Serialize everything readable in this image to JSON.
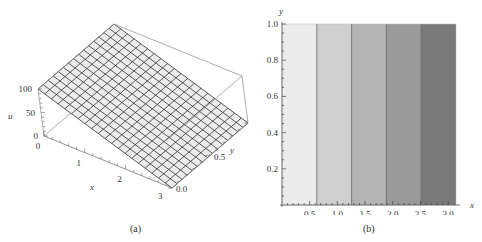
{
  "figure": {
    "panel_a_caption": "(a)",
    "panel_b_caption": "(b)"
  },
  "chart_data": [
    {
      "type": "surface3d",
      "panel": "(a)",
      "title": "",
      "xlabel": "x",
      "ylabel": "y",
      "zlabel": "u",
      "x_ticks": [
        "0",
        "1",
        "2",
        "3"
      ],
      "y_ticks": [
        "0.0",
        "0.5",
        "1.0"
      ],
      "z_ticks": [
        "0",
        "50",
        "100"
      ],
      "xlim": [
        0,
        3.14159
      ],
      "ylim": [
        0,
        1
      ],
      "zlim": [
        0,
        100
      ],
      "description": "Planar surface u decreasing linearly from 100 at x=0 to 0 at x=pi, independent of y",
      "surface": {
        "u_at_x0": 100,
        "u_at_xpi": 0
      },
      "mesh": {
        "x_lines": 20,
        "y_lines": 15
      },
      "surface_color": "#ececec",
      "mesh_color": "#333333"
    },
    {
      "type": "contour",
      "panel": "(b)",
      "title": "",
      "xlabel": "x",
      "ylabel": "y",
      "x_ticks": [
        "0.5",
        "1.0",
        "1.5",
        "2.0",
        "2.5",
        "3.0"
      ],
      "y_ticks": [
        "0.2",
        "0.4",
        "0.6",
        "0.8",
        "1.0"
      ],
      "xlim": [
        0,
        3.14159
      ],
      "ylim": [
        0,
        1
      ],
      "bands": [
        {
          "x_from": 0.0,
          "x_to": 0.628,
          "color": "#ececec"
        },
        {
          "x_from": 0.628,
          "x_to": 1.257,
          "color": "#cfcfcf"
        },
        {
          "x_from": 1.257,
          "x_to": 1.885,
          "color": "#b4b4b4"
        },
        {
          "x_from": 1.885,
          "x_to": 2.513,
          "color": "#9a9a9a"
        },
        {
          "x_from": 2.513,
          "x_to": 3.14159,
          "color": "#7a7a7a"
        }
      ],
      "contour_lines_x": [
        0.628,
        1.257,
        1.885,
        2.513
      ]
    }
  ]
}
